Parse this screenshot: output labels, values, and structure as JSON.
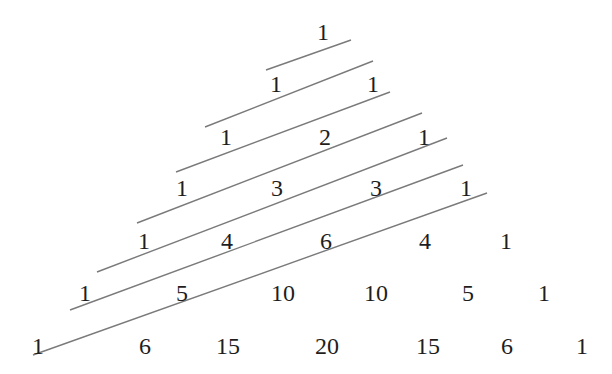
{
  "rows": [
    [
      1
    ],
    [
      1,
      1
    ],
    [
      1,
      2,
      1
    ],
    [
      1,
      3,
      3,
      1
    ],
    [
      1,
      4,
      6,
      4,
      1
    ],
    [
      1,
      5,
      10,
      10,
      5,
      1
    ],
    [
      1,
      6,
      15,
      20,
      15,
      6,
      1
    ]
  ],
  "diagonal_count": 7,
  "colors": {
    "text": "#1e1e1e",
    "line": "#7a7a7a"
  }
}
